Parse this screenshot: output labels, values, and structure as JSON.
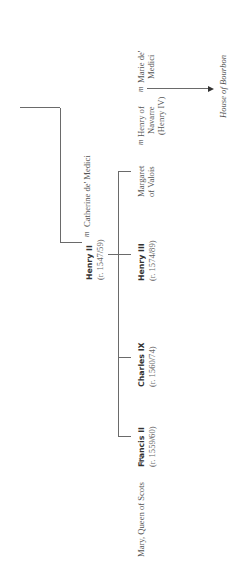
{
  "marriage_symbol": "m",
  "ancestor_line": {
    "label": ""
  },
  "henry_ii": {
    "name": "Henry II",
    "reign": "(r. 1547/59)"
  },
  "catherine": {
    "name": "Catherine de' Medici"
  },
  "children": [
    {
      "name": "Francis II",
      "reign": "(r. 1559/60)"
    },
    {
      "name": "Charles IX",
      "reign": "(r. 1560/74)"
    },
    {
      "name": "Henry III",
      "reign": "(r. 1574/89)"
    }
  ],
  "margaret": {
    "line1": "Margaret",
    "line2": "of Valois"
  },
  "mary": {
    "name": "Mary, Queen of Scots"
  },
  "henry_navarre": {
    "line1": "Henry of",
    "line2": "Navarre",
    "line3": "(Henry IV)"
  },
  "marie": {
    "line1": "Marie de'",
    "line2": "Medici"
  },
  "bourbon": {
    "label": "House of Bourbon"
  },
  "colors": {
    "line": "#6a6a6a",
    "text": "#555555",
    "name_text": "#333333"
  }
}
